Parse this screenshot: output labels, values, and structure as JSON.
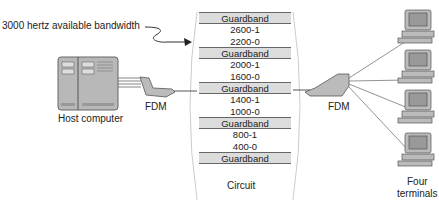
{
  "annotation": {
    "bandwidth_label": "3000 hertz available bandwidth"
  },
  "host": {
    "label": "Host computer"
  },
  "mux_left": {
    "label": "FDM"
  },
  "mux_right": {
    "label": "FDM"
  },
  "circuit": {
    "label": "Circuit",
    "bands": [
      {
        "type": "guard",
        "label": "Guardband"
      },
      {
        "type": "freq",
        "label": "2600-1"
      },
      {
        "type": "freq",
        "label": "2200-0"
      },
      {
        "type": "guard",
        "label": "Guardband"
      },
      {
        "type": "freq",
        "label": "2000-1"
      },
      {
        "type": "freq",
        "label": "1600-0"
      },
      {
        "type": "guard",
        "label": "Guardband"
      },
      {
        "type": "freq",
        "label": "1400-1"
      },
      {
        "type": "freq",
        "label": "1000-0"
      },
      {
        "type": "guard",
        "label": "Guardband"
      },
      {
        "type": "freq",
        "label": "800-1"
      },
      {
        "type": "freq",
        "label": "400-0"
      },
      {
        "type": "guard",
        "label": "Guardband"
      }
    ]
  },
  "terminals": {
    "label_line1": "Four",
    "label_line2": "terminals",
    "count": 4
  },
  "colors": {
    "guardband": "#dcdcdc",
    "device": "#b8b8b8",
    "line": "#777777"
  }
}
